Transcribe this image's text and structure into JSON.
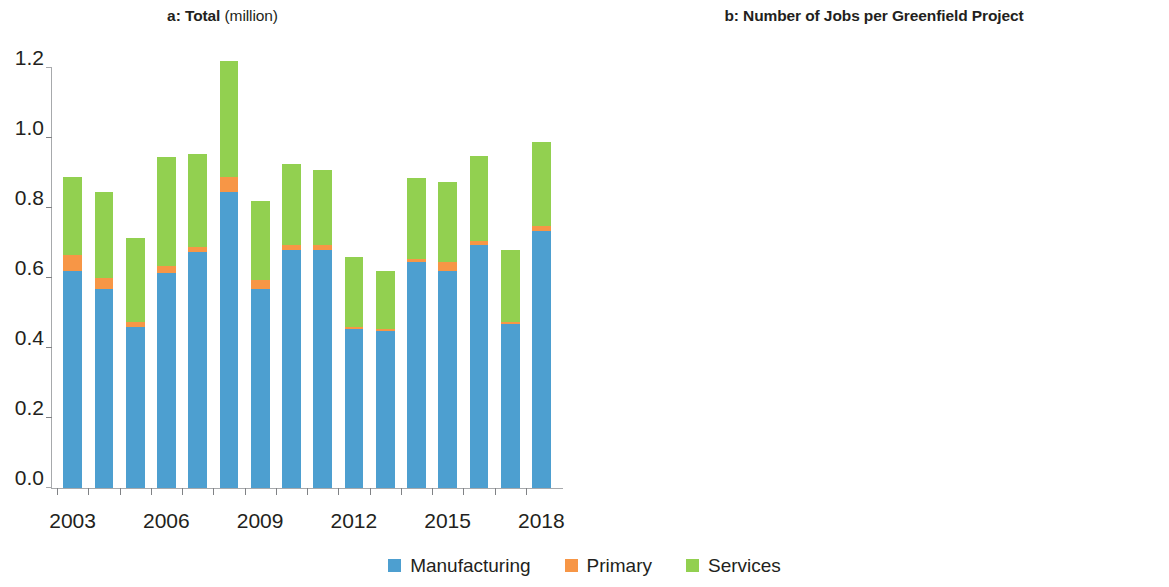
{
  "colors": {
    "manufacturing": "#4d9fd0",
    "primary": "#f79646",
    "services": "#92d050",
    "axis": "#a7a9ac",
    "text": "#231f20"
  },
  "legend": {
    "items": [
      {
        "label": "Manufacturing",
        "color": "#4d9fd0",
        "key": "manufacturing"
      },
      {
        "label": "Primary",
        "color": "#f79646",
        "key": "primary"
      },
      {
        "label": "Services",
        "color": "#92d050",
        "key": "services"
      }
    ]
  },
  "panels": [
    {
      "id": "a",
      "prefix": "a:",
      "title_bold": "Total",
      "title_light": "(million)"
    },
    {
      "id": "b",
      "prefix": "b:",
      "title_bold": "Number of Jobs per Greenfield Project",
      "title_light": ""
    }
  ],
  "chart_data": [
    {
      "id": "panel-a",
      "type": "bar",
      "stacked": true,
      "title": "a: Total (million)",
      "subtitle": "",
      "xlabel": "",
      "ylabel": "",
      "ylim": [
        0.0,
        1.2
      ],
      "yticks": [
        0.0,
        0.2,
        0.4,
        0.6,
        0.8,
        1.0,
        1.2
      ],
      "ytick_labels": [
        "0.0",
        "0.2",
        "0.4",
        "0.6",
        "0.8",
        "1.0",
        "1.2"
      ],
      "grid": false,
      "legend_position": "bottom-center",
      "categories": [
        2003,
        2004,
        2005,
        2006,
        2007,
        2008,
        2009,
        2010,
        2011,
        2012,
        2013,
        2014,
        2015,
        2016,
        2017,
        2018
      ],
      "xtick_labels": [
        "2003",
        "",
        "",
        "2006",
        "",
        "",
        "2009",
        "",
        "",
        "2012",
        "",
        "",
        "2015",
        "",
        "",
        "2018"
      ],
      "series": [
        {
          "name": "Manufacturing",
          "color": "#4d9fd0",
          "values": [
            0.62,
            0.57,
            0.46,
            0.615,
            0.675,
            0.845,
            0.57,
            0.68,
            0.68,
            0.455,
            0.45,
            0.645,
            0.62,
            0.695,
            0.47,
            0.735
          ]
        },
        {
          "name": "Primary",
          "color": "#f79646",
          "values": [
            0.045,
            0.03,
            0.015,
            0.02,
            0.015,
            0.045,
            0.025,
            0.015,
            0.015,
            0.005,
            0.005,
            0.01,
            0.025,
            0.01,
            0.005,
            0.015
          ]
        },
        {
          "name": "Services",
          "color": "#92d050",
          "values": [
            0.225,
            0.245,
            0.24,
            0.31,
            0.265,
            0.33,
            0.225,
            0.23,
            0.215,
            0.2,
            0.165,
            0.23,
            0.23,
            0.245,
            0.205,
            0.24
          ]
        }
      ],
      "totals": [
        0.89,
        0.845,
        0.715,
        0.945,
        0.955,
        1.22,
        0.82,
        0.925,
        0.91,
        0.66,
        0.62,
        0.885,
        0.875,
        0.95,
        0.68,
        0.99
      ]
    },
    {
      "id": "panel-b",
      "type": "bar",
      "stacked": false,
      "title": "b: Number of Jobs per Greenfield Project",
      "subtitle": "",
      "xlabel": "",
      "ylabel": "",
      "ylim": [
        0,
        400
      ],
      "yticks": [
        0,
        50,
        100,
        150,
        200,
        250,
        300,
        350,
        400
      ],
      "ytick_labels": [
        "0",
        "50",
        "100",
        "150",
        "200",
        "250",
        "300",
        "350",
        "400"
      ],
      "grid": false,
      "legend_position": "bottom-center",
      "categories": [
        2003,
        2004,
        2005,
        2006,
        2007,
        2008,
        2009,
        2010,
        2011,
        2012,
        2013,
        2014,
        2015,
        2016,
        2017,
        2018
      ],
      "xtick_labels": [
        "2003",
        "",
        "",
        "2006",
        "",
        "",
        "2009",
        "",
        "",
        "2012",
        "",
        "",
        "2015",
        "",
        "",
        "2018"
      ],
      "series": [
        {
          "name": "Manufacturing",
          "color": "#4d9fd0",
          "values": [
            336,
            303,
            288,
            330,
            374,
            334,
            291,
            315,
            291,
            259,
            234,
            324,
            338,
            371,
            280,
            366
          ]
        },
        {
          "name": "Primary",
          "color": "#f79646",
          "values": [
            204,
            154,
            126,
            121,
            119,
            203,
            139,
            146,
            136,
            65,
            87,
            113,
            186,
            149,
            100,
            144
          ]
        },
        {
          "name": "Services",
          "color": "#92d050",
          "values": [
            202,
            176,
            173,
            180,
            152,
            142,
            117,
            115,
            97,
            90,
            78,
            110,
            123,
            127,
            111,
            117
          ]
        }
      ]
    }
  ]
}
